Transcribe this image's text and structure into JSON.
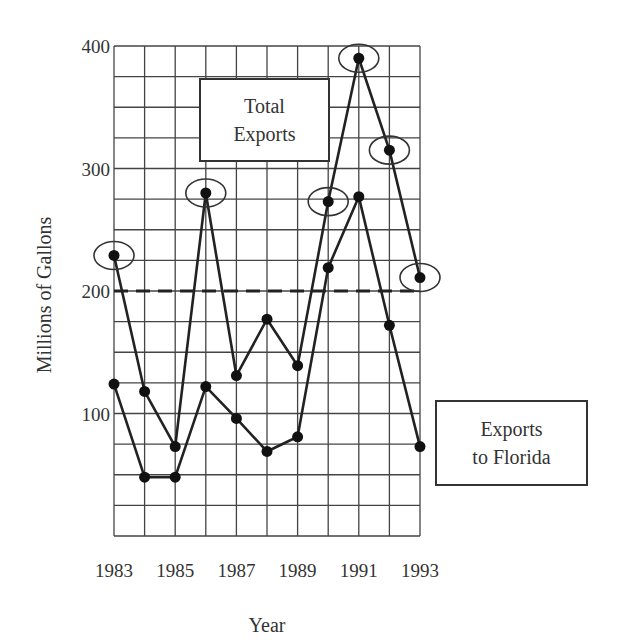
{
  "chart_data": {
    "type": "line",
    "title": "",
    "xlabel": "Year",
    "ylabel": "Millions of Gallons",
    "x": [
      1983,
      1984,
      1985,
      1986,
      1987,
      1988,
      1989,
      1990,
      1991,
      1992,
      1993
    ],
    "x_tick_labels": [
      "1983",
      "1985",
      "1987",
      "1989",
      "1991",
      "1993"
    ],
    "y_tick_labels": [
      "100",
      "200",
      "300",
      "400"
    ],
    "ylim": [
      0,
      400
    ],
    "grid": true,
    "grid_step_y": 25,
    "series": [
      {
        "name": "Total Exports",
        "values": [
          229,
          118,
          73,
          280,
          131,
          177,
          139,
          273,
          390,
          315,
          211
        ],
        "circled_points": [
          1983,
          1986,
          1990,
          1991,
          1992,
          1993
        ]
      },
      {
        "name": "Exports to Florida",
        "values": [
          124,
          48,
          48,
          122,
          96,
          69,
          81,
          219,
          277,
          172,
          73
        ]
      }
    ],
    "reference_line": {
      "value": 200,
      "style": "dashed"
    },
    "annotations": [
      {
        "text": "Total Exports",
        "position": "upper-center"
      },
      {
        "text": "Exports to Florida",
        "position": "right"
      }
    ]
  },
  "legend": {
    "total_line1": "Total",
    "total_line2": "Exports",
    "florida_line1": "Exports",
    "florida_line2": "to Florida"
  }
}
